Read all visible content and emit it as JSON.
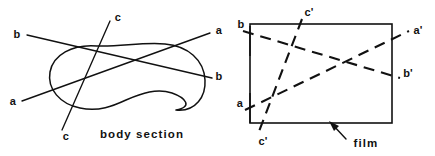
{
  "figure": {
    "background_color": "#ffffff",
    "ink_color": "#111111",
    "width": 435,
    "height": 156
  },
  "left_panel": {
    "caption": "body section",
    "shape_name": "body-section-outline",
    "labels": {
      "a_left": "a",
      "a_right": "a",
      "b_left": "b",
      "b_right": "b",
      "c_top": "c",
      "c_bottom": "c"
    },
    "rays": [
      {
        "name": "ray-a",
        "start_label": "a",
        "end_label": "a",
        "style": "solid"
      },
      {
        "name": "ray-b",
        "start_label": "b",
        "end_label": "b",
        "style": "solid"
      },
      {
        "name": "ray-c",
        "start_label": "c",
        "end_label": "c",
        "style": "solid"
      }
    ]
  },
  "right_panel": {
    "caption": "film",
    "frame_name": "film-frame",
    "labels": {
      "a_in": "a",
      "a_out": "a'",
      "b_in": "b",
      "b_out": "b'",
      "c_top": "c'",
      "c_bottom": "c'"
    },
    "rays": [
      {
        "name": "ray-a-prime",
        "start_label": "a",
        "end_label": "a'",
        "style": "dashed"
      },
      {
        "name": "ray-b-prime",
        "start_label": "b",
        "end_label": "b'",
        "style": "dashed"
      },
      {
        "name": "ray-c-prime",
        "start_label": "c'",
        "end_label": "c'",
        "style": "dashed"
      }
    ]
  }
}
